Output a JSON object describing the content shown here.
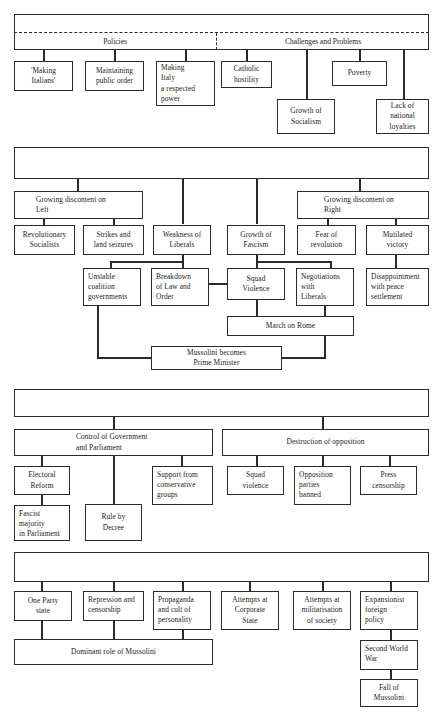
{
  "document": {
    "title": "Italy 1870-1943 Flow Diagram",
    "line_color": "#2a2a2a",
    "background": "#ffffff"
  },
  "sections": [
    {
      "id": "section-1",
      "header": "1870 – Liberal Regime – 1915",
      "branches": [
        "Policies",
        "Challenges and Problems"
      ],
      "boxes": [
        "'Making\nItalians'",
        "Maintaining\npublic order",
        "Making\nItaly\na respected\npower",
        "Catholic\nhostility",
        "Growth of\nSocialism",
        "Poverty",
        "Lack of\nnational\nloyalties"
      ]
    },
    {
      "id": "section-2",
      "header": "1915 – Collapse of Liberalism/ Growth of Fascism – 1922",
      "branches": [
        "Growing discontent on\nLeft",
        "Growing discontent on\nRight"
      ],
      "boxes": [
        "Revolutionary\nSocialists",
        "Strikes and\nland seizures",
        "Weakness of\nLiberals",
        "Growth of\nFascism",
        "Fear of\nrevolution",
        "Mutilated\nvictory",
        "Unstable\ncoalition\ngovernments",
        "Breakdown\nof Law and\nOrder",
        "Squad\nViolence",
        "Negotiations\nwith\nLiberals",
        "Disappointment\nwith peace\nsettlement",
        "March on Rome",
        "Mussolini becomes\nPrime Minister"
      ]
    },
    {
      "id": "section-3",
      "header": "1922 – Establishment of the Fascist Dictatorship – 1926",
      "branches": [
        "Control of Government\nand Parliament",
        "Destruction of opposition"
      ],
      "boxes": [
        "Electoral\nReform",
        "Rule by\nDecree",
        "Support from\nconservative\ngroups",
        "Fascist\nmajority\nin Parliament",
        "Squad\nviolence",
        "Opposition\nparties\nbanned",
        "Press\ncensorship"
      ]
    },
    {
      "id": "section-4",
      "header": "1926 – Mussolini's Dictatorship – 1943",
      "branches": [],
      "boxes": [
        "One Party\nstate",
        "Repression and\ncensorship",
        "Propaganda\nand cult of\npersonality",
        "Attempts at\nCorporate\nState",
        "Attempts at\nmilitarisation\nof society",
        "Expansionist\nforeign\npolicy",
        "Dominant role of Mussolini",
        "Second World\nWar",
        "Fall of\nMussolini"
      ]
    }
  ],
  "s1": {
    "header": "1870 – Liberal Regime – 1915",
    "policies": "Policies",
    "challenges": "Challenges and Problems",
    "b1": "'Making\nItalians'",
    "b2": "Maintaining\npublic order",
    "b3": "Making\nItaly\na respected\npower",
    "b4": "Catholic\nhostility",
    "b5": "Growth of\nSocialism",
    "b6": "Poverty",
    "b7": "Lack of\nnational\nloyalties"
  },
  "s2": {
    "header": "1915 – Collapse of Liberalism/ Growth of Fascism – 1922",
    "left": "Growing discontent on\nLeft",
    "right": "Growing discontent on\nRight",
    "b1": "Revolutionary\nSocialists",
    "b2": "Strikes and\nland seizures",
    "b3": "Weakness of\nLiberals",
    "b4": "Growth of\nFascism",
    "b5": "Fear of\nrevolution",
    "b6": "Mutilated\nvictory",
    "b7": "Unstable\ncoalition\ngovernments",
    "b8": "Breakdown\nof Law and\nOrder",
    "b9": "Squad\nViolence",
    "b10": "Negotiations\nwith\nLiberals",
    "b11": "Disappointment\nwith peace\nsettlement",
    "b12": "March on Rome",
    "b13": "Mussolini becomes\nPrime Minister"
  },
  "s3": {
    "header": "1922 – Establishment of the Fascist Dictatorship – 1926",
    "left": "Control of Government\nand Parliament",
    "right": "Destruction of opposition",
    "b1": "Electoral\nReform",
    "b2": "Rule by\nDecree",
    "b3": "Support from\nconservative\ngroups",
    "b4": "Fascist\nmajority\nin Parliament",
    "b5": "Squad\nviolence",
    "b6": "Opposition\nparties\nbanned",
    "b7": "Press\ncensorship"
  },
  "s4": {
    "header": "1926 – Mussolini's Dictatorship – 1943",
    "b1": "One Party\nstate",
    "b2": "Repression and\ncensorship",
    "b3": "Propaganda\nand cult of\npersonality",
    "b4": "Attempts at\nCorporate\nState",
    "b5": "Attempts at\nmilitarisation\nof society",
    "b6": "Expansionist\nforeign\npolicy",
    "b7": "Dominant role of Mussolini",
    "b8": "Second World\nWar",
    "b9": "Fall of\nMussolini"
  }
}
